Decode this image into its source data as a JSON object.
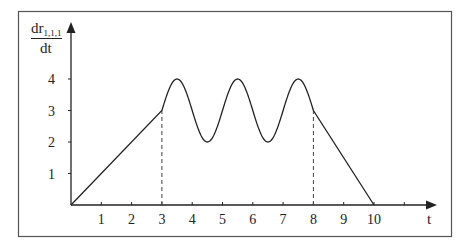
{
  "chart_data": {
    "type": "line",
    "title": "",
    "xlabel": "t",
    "ylabel": {
      "numerator": "dr",
      "subscript": "1,1,1",
      "denominator": "dt"
    },
    "x_ticks": [
      1,
      2,
      3,
      4,
      5,
      6,
      7,
      8,
      9,
      10
    ],
    "x_tick_marks": [
      1,
      2,
      3,
      4,
      5,
      6,
      7,
      8,
      9,
      10,
      11
    ],
    "y_ticks": [
      1,
      2,
      3,
      4
    ],
    "xlim": [
      0,
      12
    ],
    "ylim": [
      0,
      5
    ],
    "grid": false,
    "legend": null,
    "series": [
      {
        "name": "dr_1,1,1/dt",
        "segments": [
          {
            "kind": "linear",
            "from": [
              0,
              0
            ],
            "to": [
              3,
              3
            ]
          },
          {
            "kind": "sinusoid",
            "t_range": [
              3,
              8
            ],
            "formula": "3 + sin(pi*(t-3))",
            "peaks": [
              [
                3.5,
                4
              ],
              [
                5.5,
                4
              ],
              [
                7.5,
                4
              ]
            ],
            "troughs": [
              [
                4.5,
                2
              ],
              [
                6.5,
                2
              ]
            ]
          },
          {
            "kind": "linear",
            "from": [
              8,
              3
            ],
            "to": [
              10,
              0
            ]
          }
        ],
        "x": [
          0,
          3,
          3.5,
          4.5,
          5.5,
          6.5,
          7.5,
          8,
          10
        ],
        "values": [
          0,
          3,
          4,
          2,
          4,
          2,
          4,
          3,
          0
        ]
      }
    ],
    "annotations": [
      {
        "type": "dashed-vertical",
        "x": 3,
        "from_y": 0,
        "to_y": 3
      },
      {
        "type": "dashed-vertical",
        "x": 8,
        "from_y": 0,
        "to_y": 3
      }
    ]
  },
  "colors": {
    "line": "#222222",
    "axis": "#222222",
    "frame": "#555555"
  }
}
